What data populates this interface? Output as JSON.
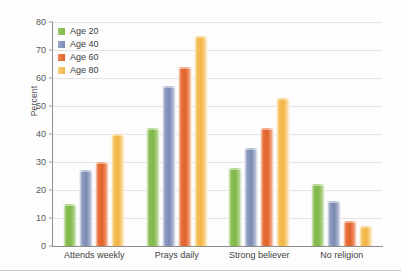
{
  "chart_data": {
    "type": "bar",
    "title": "",
    "xlabel": "",
    "ylabel": "Percent",
    "ylim": [
      0,
      80
    ],
    "ytick_step": 10,
    "yticks": [
      0,
      10,
      20,
      30,
      40,
      50,
      60,
      70,
      80
    ],
    "grid": true,
    "legend_position": "top-left",
    "categories": [
      "Attends weekly",
      "Prays daily",
      "Strong believer",
      "No religion"
    ],
    "series": [
      {
        "name": "Age 20",
        "color": "#7fb84b",
        "values": [
          15,
          42,
          28,
          22
        ]
      },
      {
        "name": "Age 40",
        "color": "#7a8ab4",
        "values": [
          27,
          57,
          35,
          16
        ]
      },
      {
        "name": "Age 60",
        "color": "#e0622b",
        "values": [
          30,
          64,
          42,
          9
        ]
      },
      {
        "name": "Age 80",
        "color": "#f2b544",
        "values": [
          40,
          75,
          53,
          7
        ]
      }
    ]
  }
}
